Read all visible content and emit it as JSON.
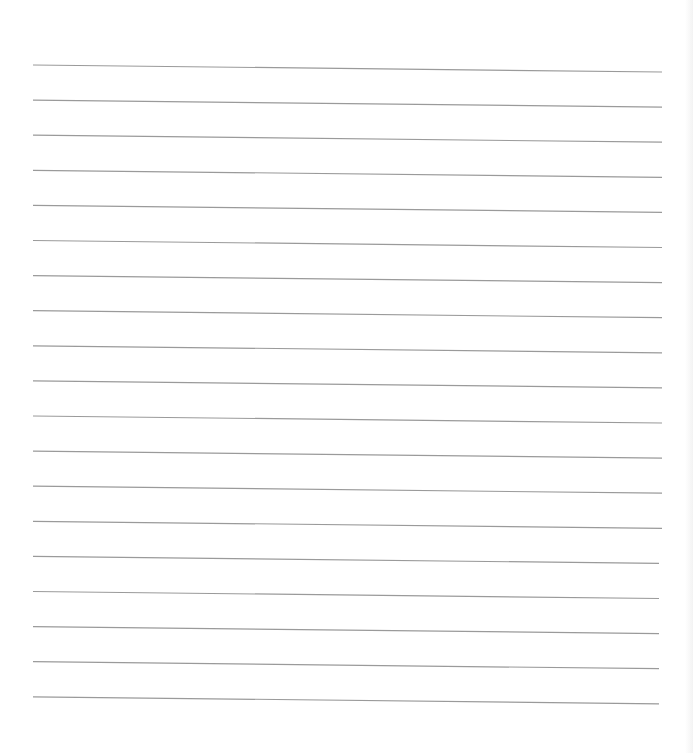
{
  "page": {
    "type": "lined-paper",
    "background_color": "#ffffff",
    "line_color": "#9a9a9a",
    "line_count": 19,
    "line_start_x": 33,
    "line_end_x": 662,
    "first_line_left_y": 65,
    "line_spacing": 35.1,
    "right_drop": 7
  }
}
